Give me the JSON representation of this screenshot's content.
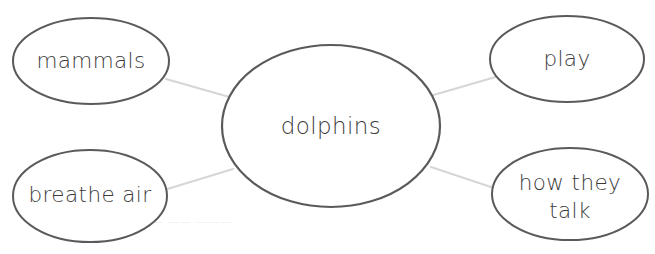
{
  "canvas": {
    "width": 655,
    "height": 254,
    "background": "#ffffff"
  },
  "theme": {
    "ellipse_stroke": "#5a5a5a",
    "ellipse_fill": "#ffffff",
    "connector_stroke": "#d6d6d6",
    "text_color": "#3b3b3b",
    "ghost_text_color": "#f0f0f0"
  },
  "diagram": {
    "type": "word-web",
    "center": {
      "label": "dolphins",
      "cx": 331,
      "cy": 126,
      "rx": 109,
      "ry": 81
    },
    "nodes": [
      {
        "id": "mammals",
        "label": "mammals",
        "lines": [
          "mammals"
        ],
        "cx": 91,
        "cy": 61,
        "rx": 78,
        "ry": 43
      },
      {
        "id": "play",
        "label": "play",
        "lines": [
          "play"
        ],
        "cx": 567,
        "cy": 59,
        "rx": 77,
        "ry": 43
      },
      {
        "id": "breathe-air",
        "label": "breathe air",
        "lines": [
          "breathe air"
        ],
        "cx": 90,
        "cy": 196,
        "rx": 77,
        "ry": 46
      },
      {
        "id": "how-they-talk",
        "label": "how they talk",
        "lines": [
          "how they",
          "talk"
        ],
        "cx": 570,
        "cy": 194,
        "rx": 78,
        "ry": 46
      }
    ],
    "connectors": [
      {
        "id": "center-to-mammals",
        "from": "dolphins",
        "to": "mammals",
        "x1": 233,
        "y1": 98,
        "x2": 166,
        "y2": 79
      },
      {
        "id": "center-to-play",
        "from": "dolphins",
        "to": "play",
        "x1": 430,
        "y1": 96,
        "x2": 499,
        "y2": 76
      },
      {
        "id": "center-to-breathe-air",
        "from": "dolphins",
        "to": "breathe air",
        "x1": 233,
        "y1": 169,
        "x2": 164,
        "y2": 190
      },
      {
        "id": "center-to-how-they-talk",
        "from": "dolphins",
        "to": "how they talk",
        "x1": 431,
        "y1": 167,
        "x2": 500,
        "y2": 190
      }
    ]
  }
}
